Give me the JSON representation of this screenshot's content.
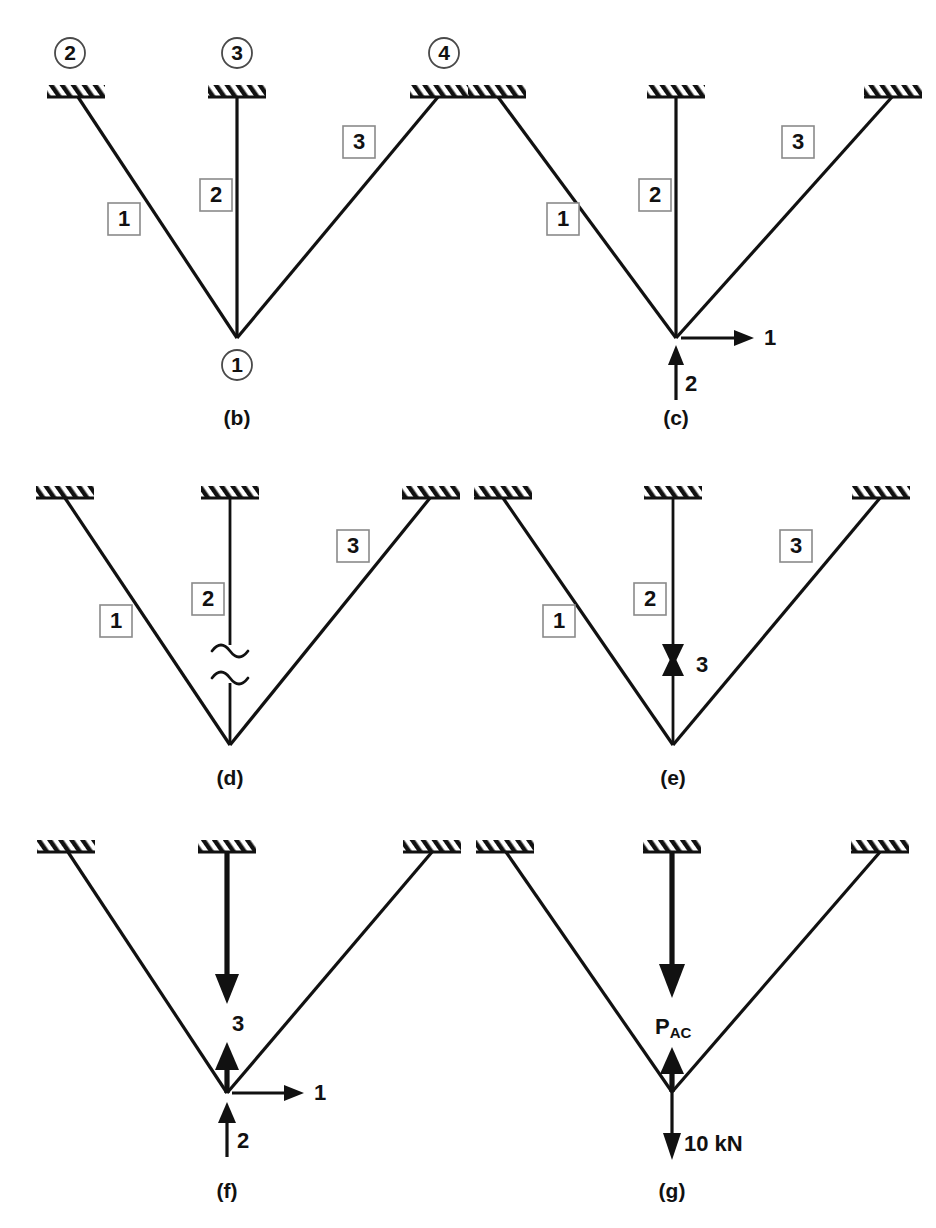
{
  "figure": {
    "background_color": "#ffffff",
    "ink_color": "#111111",
    "label_box_border_color": "#8a8a8a"
  },
  "panels": [
    {
      "id": "b",
      "caption": "(b)",
      "node_labels": [
        {
          "text": "2",
          "position": "above-left-support"
        },
        {
          "text": "3",
          "position": "above-center-support"
        },
        {
          "text": "4",
          "position": "above-right-support"
        },
        {
          "text": "1",
          "position": "below-joint"
        }
      ],
      "member_labels": [
        {
          "text": "1",
          "member": "left-diagonal"
        },
        {
          "text": "2",
          "member": "center-vertical"
        },
        {
          "text": "3",
          "member": "right-diagonal"
        }
      ],
      "force_labels": [],
      "supports": 3
    },
    {
      "id": "c",
      "caption": "(c)",
      "node_labels": [],
      "member_labels": [
        {
          "text": "1",
          "member": "left-diagonal"
        },
        {
          "text": "2",
          "member": "center-vertical"
        },
        {
          "text": "3",
          "member": "right-diagonal"
        }
      ],
      "force_labels": [
        {
          "text": "1",
          "direction": "right",
          "anchor": "joint"
        },
        {
          "text": "2",
          "direction": "up",
          "anchor": "below-joint"
        }
      ],
      "supports": 3
    },
    {
      "id": "d",
      "caption": "(d)",
      "node_labels": [],
      "member_labels": [
        {
          "text": "1",
          "member": "left-diagonal"
        },
        {
          "text": "2",
          "member": "center-vertical"
        },
        {
          "text": "3",
          "member": "right-diagonal"
        }
      ],
      "force_labels": [],
      "break_marks": 2,
      "supports": 3
    },
    {
      "id": "e",
      "caption": "(e)",
      "node_labels": [],
      "member_labels": [
        {
          "text": "1",
          "member": "left-diagonal"
        },
        {
          "text": "2",
          "member": "center-vertical"
        },
        {
          "text": "3",
          "member": "right-diagonal"
        }
      ],
      "force_labels": [
        {
          "text": "3",
          "direction": "opposed-pair",
          "anchor": "center-member"
        }
      ],
      "supports": 3
    },
    {
      "id": "f",
      "caption": "(f)",
      "node_labels": [],
      "member_labels": [],
      "force_labels": [
        {
          "text": "3",
          "direction": "down-and-up",
          "anchor": "center-member"
        },
        {
          "text": "1",
          "direction": "right",
          "anchor": "joint"
        },
        {
          "text": "2",
          "direction": "up",
          "anchor": "below-joint"
        }
      ],
      "supports": 3
    },
    {
      "id": "g",
      "caption": "(g)",
      "node_labels": [],
      "member_labels": [],
      "force_labels": [
        {
          "text": "P",
          "subscript": "AC",
          "direction": "down-and-up",
          "anchor": "center-member"
        },
        {
          "text": "10 kN",
          "direction": "down",
          "anchor": "below-joint"
        }
      ],
      "supports": 3
    }
  ],
  "captions": {
    "b": "(b)",
    "c": "(c)",
    "d": "(d)",
    "e": "(e)",
    "f": "(f)",
    "g": "(g)"
  },
  "panel_b": {
    "node_2": "2",
    "node_3": "3",
    "node_4": "4",
    "node_1": "1",
    "member_1": "1",
    "member_2": "2",
    "member_3": "3"
  },
  "panel_c": {
    "member_1": "1",
    "member_2": "2",
    "member_3": "3",
    "force_h": "1",
    "force_v": "2"
  },
  "panel_d": {
    "member_1": "1",
    "member_2": "2",
    "member_3": "3"
  },
  "panel_e": {
    "member_1": "1",
    "member_2": "2",
    "member_3": "3",
    "force_3": "3"
  },
  "panel_f": {
    "force_3": "3",
    "force_h": "1",
    "force_v": "2"
  },
  "panel_g": {
    "force_p": "P",
    "force_p_sub": "AC",
    "force_load": "10 kN"
  }
}
